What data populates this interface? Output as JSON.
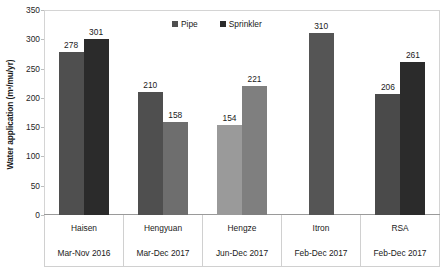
{
  "chart_data": {
    "type": "bar",
    "title": "",
    "xlabel": "",
    "ylabel": "Water application (m³/mu/yr)",
    "ylim": [
      0,
      350
    ],
    "yticks": [
      0,
      50,
      100,
      150,
      200,
      250,
      300,
      350
    ],
    "ytick_labels": [
      "0",
      "50",
      "100",
      "150",
      "200",
      "250",
      "300",
      "350"
    ],
    "grid": false,
    "legend_position": "top-center",
    "categories": [
      "Haisen",
      "Hengyuan",
      "Hengze",
      "Itron",
      "RSA"
    ],
    "category_periods": [
      "Mar-Nov 2016",
      "Mar-Dec 2017",
      "Jun-Dec 2017",
      "Feb-Dec 2017",
      "Feb-Dec 2017"
    ],
    "series": [
      {
        "name": "Pipe",
        "color": "#4f4f4f",
        "values": [
          278,
          210,
          154,
          310,
          206
        ],
        "value_labels": [
          "278",
          "210",
          "154",
          "310",
          "206"
        ]
      },
      {
        "name": "Sprinkler",
        "color": "#2b2b2b",
        "values": [
          301,
          158,
          221,
          null,
          261
        ],
        "value_labels": [
          "301",
          "158",
          "221",
          "",
          "261"
        ]
      }
    ],
    "bar_colors": [
      [
        "#4f4f4f",
        "#2b2b2b"
      ],
      [
        "#4f4f4f",
        "#6e6e6e"
      ],
      [
        "#9a9a9a",
        "#7f7f7f"
      ],
      [
        "#555555",
        null
      ],
      [
        "#4a4a4a",
        "#2b2b2b"
      ]
    ]
  },
  "legend": {
    "items": [
      {
        "label": "Pipe",
        "color": "#4f4f4f"
      },
      {
        "label": "Sprinkler",
        "color": "#2b2b2b"
      }
    ]
  },
  "axis": {
    "y_title": "Water application (m³/mu/yr)"
  }
}
